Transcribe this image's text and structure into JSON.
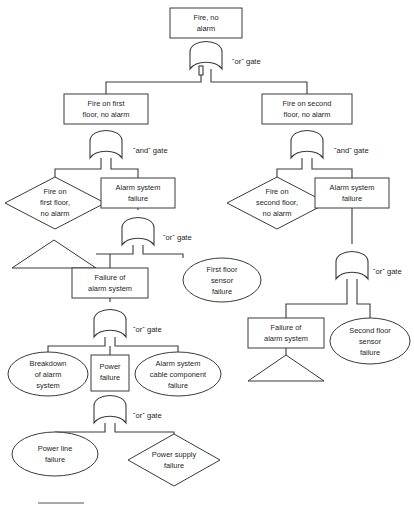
{
  "diagram": {
    "type": "fault-tree",
    "stroke_color": "#3a3a3a",
    "background_color": "#ffffff",
    "nodes": [
      {
        "id": "top",
        "shape": "rect",
        "label": "Fire, no\nalarm",
        "x": 170,
        "y": 8,
        "w": 72,
        "h": 30
      },
      {
        "id": "fire-first",
        "shape": "rect",
        "label": "Fire on first\nfloor, no alarm",
        "x": 64,
        "y": 94,
        "w": 84,
        "h": 30
      },
      {
        "id": "fire-second",
        "shape": "rect",
        "label": "Fire on second\nfloor, no alarm",
        "x": 262,
        "y": 94,
        "w": 90,
        "h": 30
      },
      {
        "id": "diamond-first",
        "shape": "diamond",
        "label": "Fire on\nfirst floor,\nno alarm",
        "x": 5,
        "y": 177,
        "w": 100,
        "h": 52
      },
      {
        "id": "alarm-fail-left",
        "shape": "rect",
        "label": "Alarm system\nfailure",
        "x": 101,
        "y": 178,
        "w": 74,
        "h": 30
      },
      {
        "id": "diamond-second",
        "shape": "diamond",
        "label": "Fire on\nsecond floor,\nno alarm",
        "x": 227,
        "y": 177,
        "w": 100,
        "h": 52
      },
      {
        "id": "alarm-fail-right",
        "shape": "rect",
        "label": "Alarm system\nfailure",
        "x": 315,
        "y": 178,
        "w": 74,
        "h": 30
      },
      {
        "id": "transfer-left",
        "shape": "triangle",
        "label": "",
        "x": 12,
        "y": 240,
        "w": 84,
        "h": 28
      },
      {
        "id": "first-sensor",
        "shape": "ellipse",
        "label": "First floor\nsensor\nfailure",
        "x": 183,
        "y": 258,
        "w": 78,
        "h": 44
      },
      {
        "id": "failure-alarm-left",
        "shape": "rect",
        "label": "Failure of\nalarm system",
        "x": 72,
        "y": 268,
        "w": 76,
        "h": 30
      },
      {
        "id": "failure-alarm-right",
        "shape": "rect",
        "label": "Failure of\nalarm system",
        "x": 248,
        "y": 318,
        "w": 76,
        "h": 30
      },
      {
        "id": "second-sensor",
        "shape": "ellipse",
        "label": "Second floor\nsensor\nfailure",
        "x": 330,
        "y": 318,
        "w": 80,
        "h": 46
      },
      {
        "id": "transfer-right",
        "shape": "triangle",
        "label": "",
        "x": 248,
        "y": 355,
        "w": 76,
        "h": 26
      },
      {
        "id": "breakdown",
        "shape": "ellipse",
        "label": "Breakdown\nof alarm\nsystem",
        "x": 8,
        "y": 352,
        "w": 80,
        "h": 44
      },
      {
        "id": "power-failure",
        "shape": "rect",
        "label": "Power\nfailure",
        "x": 91,
        "y": 355,
        "w": 38,
        "h": 36
      },
      {
        "id": "cable-component",
        "shape": "ellipse",
        "label": "Alarm system\ncable component\nfailure",
        "x": 135,
        "y": 352,
        "w": 86,
        "h": 44
      },
      {
        "id": "power-line",
        "shape": "ellipse",
        "label": "Power line\nfailure",
        "x": 12,
        "y": 432,
        "w": 86,
        "h": 44
      },
      {
        "id": "power-supply",
        "shape": "diamond",
        "label": "Power supply\nfailure",
        "x": 128,
        "y": 434,
        "w": 92,
        "h": 52
      }
    ],
    "gates": [
      {
        "id": "gate-top",
        "caption": "ˇorˇ gate",
        "type": "or",
        "cx": 206,
        "cy": 52,
        "caption_x": 232,
        "caption_y": 62
      },
      {
        "id": "gate-first-and",
        "caption": "ˇandˇ gate",
        "type": "and",
        "cx": 106,
        "cy": 141,
        "caption_x": 133,
        "caption_y": 151
      },
      {
        "id": "gate-second-and",
        "caption": "ˇandˇ gate",
        "type": "and",
        "cx": 307,
        "cy": 141,
        "caption_x": 334,
        "caption_y": 151
      },
      {
        "id": "gate-left-or",
        "caption": "ˇorˇ gate",
        "type": "or",
        "cx": 138,
        "cy": 228,
        "caption_x": 163,
        "caption_y": 238
      },
      {
        "id": "gate-right-or",
        "caption": "ˇorˇ gate",
        "type": "or",
        "cx": 352,
        "cy": 262,
        "caption_x": 373,
        "caption_y": 272
      },
      {
        "id": "gate-alarm-or",
        "caption": "ˇorˇ gate",
        "type": "or",
        "cx": 110,
        "cy": 320,
        "caption_x": 133,
        "caption_y": 330
      },
      {
        "id": "gate-power-or",
        "caption": "ˇorˇ gate",
        "type": "or",
        "cx": 110,
        "cy": 406,
        "caption_x": 133,
        "caption_y": 416
      }
    ]
  }
}
